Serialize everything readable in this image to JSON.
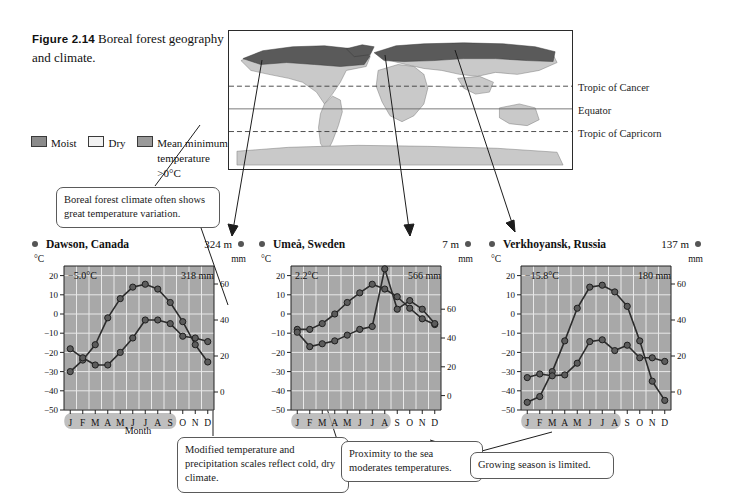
{
  "figure": {
    "number": "Figure 2.14",
    "caption": "Boreal forest geography and climate."
  },
  "legend": {
    "items": [
      {
        "label": "Moist",
        "swatch": "moist",
        "color": "#8b8b8b"
      },
      {
        "label": "Dry",
        "swatch": "dry",
        "color": "#f2f2f2"
      },
      {
        "label": "Mean minimum temperature >0°C",
        "swatch": "mean",
        "color": "#9a9a9a"
      }
    ]
  },
  "map": {
    "labels": {
      "tropic_cancer": "Tropic of Cancer",
      "equator": "Equator",
      "tropic_capricorn": "Tropic of Capricorn"
    },
    "colors": {
      "boreal": "#595959",
      "land": "#c8c8c8",
      "ocean": "#ffffff",
      "line": "#2b2b2b"
    }
  },
  "callouts": [
    {
      "id": "temperature-variation",
      "text": "Boreal forest climate often shows great temperature variation."
    },
    {
      "id": "modified-scales",
      "text": "Modified temperature and precipitation scales reflect cold, dry climate."
    },
    {
      "id": "sea-proximity",
      "text": "Proximity to the sea moderates temperatures."
    },
    {
      "id": "growing-season",
      "text": "Growing season is limited."
    }
  ],
  "chart_data": [
    {
      "type": "line",
      "title": "Dawson, Canada",
      "elevation": "324 m",
      "mean_temperature": "−5.0°C",
      "annual_precipitation": "318 mm",
      "xlabel": "Month",
      "ylabel": "°C",
      "y2label": "mm",
      "categories": [
        "J",
        "F",
        "M",
        "A",
        "M",
        "J",
        "J",
        "A",
        "S",
        "O",
        "N",
        "D"
      ],
      "ylim": [
        -50,
        25
      ],
      "yticks": [
        20,
        10,
        0,
        -10,
        -20,
        -30,
        -40,
        -50
      ],
      "y2lim": [
        -10,
        70
      ],
      "y2ticks": [
        60,
        40,
        20,
        0
      ],
      "grid": true,
      "growing_season_months": [
        "M",
        "J",
        "J",
        "A",
        "S"
      ],
      "series": [
        {
          "name": "Temperature",
          "unit": "°C",
          "values": [
            -30,
            -24,
            -16,
            -2,
            8,
            14,
            15.5,
            13,
            6,
            -4,
            -16,
            -25
          ]
        },
        {
          "name": "Precipitation",
          "unit": "mm",
          "values": [
            24,
            19,
            15,
            15,
            22,
            30,
            40,
            40,
            38,
            31,
            30,
            28
          ]
        }
      ]
    },
    {
      "type": "line",
      "title": "Umeå, Sweden",
      "elevation": "7 m",
      "mean_temperature": "2.2°C",
      "annual_precipitation": "566 mm",
      "xlabel": "Month",
      "ylabel": "°C",
      "y2label": "mm",
      "categories": [
        "J",
        "F",
        "M",
        "A",
        "M",
        "J",
        "J",
        "A",
        "S",
        "O",
        "N",
        "D"
      ],
      "ylim": [
        -50,
        25
      ],
      "yticks": [
        20,
        10,
        0,
        -10,
        -20,
        -30,
        -40,
        -50
      ],
      "y2lim": [
        -10,
        90
      ],
      "y2ticks": [
        60,
        40,
        20,
        0
      ],
      "grid": true,
      "growing_season_months": [
        "M",
        "J",
        "J",
        "A"
      ],
      "series": [
        {
          "name": "Temperature",
          "unit": "°C",
          "values": [
            -8,
            -8,
            -5,
            0,
            6,
            11,
            15.5,
            13,
            9,
            3,
            -2.5,
            -5.5
          ]
        },
        {
          "name": "Precipitation",
          "unit": "mm",
          "values": [
            44,
            34,
            36,
            38,
            42,
            46,
            48,
            88,
            60,
            66,
            60,
            50
          ]
        }
      ]
    },
    {
      "type": "line",
      "title": "Verkhoyansk, Russia",
      "elevation": "137 m",
      "mean_temperature": "−15.8°C",
      "annual_precipitation": "180 mm",
      "xlabel": "Month",
      "ylabel": "°C",
      "y2label": "mm",
      "categories": [
        "J",
        "F",
        "M",
        "A",
        "M",
        "J",
        "J",
        "A",
        "S",
        "O",
        "N",
        "D"
      ],
      "ylim": [
        -50,
        25
      ],
      "yticks": [
        20,
        10,
        0,
        -10,
        -20,
        -30,
        -40,
        -50
      ],
      "y2lim": [
        -10,
        70
      ],
      "y2ticks": [
        60,
        40,
        20,
        0
      ],
      "grid": true,
      "growing_season_months": [
        "J",
        "J",
        "A"
      ],
      "series": [
        {
          "name": "Temperature",
          "unit": "°C",
          "values": [
            -46,
            -43,
            -30,
            -14,
            3,
            14,
            15,
            11.5,
            4,
            -14,
            -35,
            -45
          ]
        },
        {
          "name": "Precipitation",
          "unit": "mm",
          "values": [
            8,
            10,
            9,
            9.5,
            16,
            28,
            29,
            23,
            26,
            19,
            19,
            17
          ]
        }
      ]
    }
  ]
}
